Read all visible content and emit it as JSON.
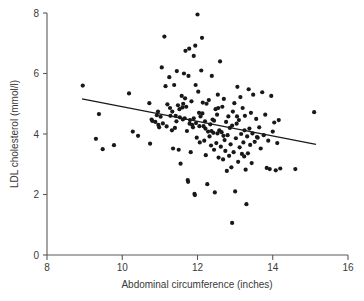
{
  "chart_data": {
    "type": "scatter",
    "title": "",
    "xlabel": "Abdominal circumference (inches)",
    "ylabel": "LDL cholesterol (mmol/l)",
    "xlim": [
      8,
      16
    ],
    "ylim": [
      0,
      8
    ],
    "xticks": [
      8,
      10,
      12,
      14,
      16
    ],
    "yticks": [
      0,
      2,
      4,
      6,
      8
    ],
    "xtick_labels": [
      "8",
      "10",
      "12",
      "14",
      "16"
    ],
    "ytick_labels": [
      "0",
      "2",
      "4",
      "6",
      "8"
    ],
    "grid": false,
    "legend": null,
    "marker": {
      "shape": "circle",
      "color": "#181818",
      "size": 2.1
    },
    "trendline": {
      "type": "linear-regression",
      "color": "#1a1a1a",
      "x_start": 8.93,
      "y_start": 5.16,
      "x_end": 15.15,
      "y_end": 3.66,
      "slope": -0.241,
      "intercept": 7.31
    },
    "points": [
      [
        8.95,
        5.6
      ],
      [
        9.38,
        4.66
      ],
      [
        9.3,
        3.84
      ],
      [
        9.48,
        3.5
      ],
      [
        9.78,
        3.63
      ],
      [
        10.18,
        5.34
      ],
      [
        10.28,
        4.08
      ],
      [
        10.42,
        3.94
      ],
      [
        10.72,
        5.02
      ],
      [
        10.74,
        3.68
      ],
      [
        10.78,
        4.48
      ],
      [
        10.8,
        4.43
      ],
      [
        10.88,
        4.4
      ],
      [
        10.92,
        4.62
      ],
      [
        10.95,
        4.74
      ],
      [
        10.96,
        4.3
      ],
      [
        10.98,
        4.22
      ],
      [
        11.02,
        4.57
      ],
      [
        11.05,
        6.2
      ],
      [
        11.08,
        4.35
      ],
      [
        11.12,
        7.22
      ],
      [
        11.15,
        5.58
      ],
      [
        11.18,
        4.25
      ],
      [
        11.2,
        4.98
      ],
      [
        11.25,
        5.88
      ],
      [
        11.28,
        4.6
      ],
      [
        11.32,
        4.12
      ],
      [
        11.35,
        3.52
      ],
      [
        11.38,
        5.62
      ],
      [
        11.4,
        4.2
      ],
      [
        11.42,
        4.6
      ],
      [
        11.45,
        6.08
      ],
      [
        11.48,
        4.95
      ],
      [
        11.5,
        3.48
      ],
      [
        11.52,
        4.82
      ],
      [
        11.55,
        3.02
      ],
      [
        11.58,
        5.26
      ],
      [
        11.6,
        4.88
      ],
      [
        11.62,
        5.0
      ],
      [
        11.64,
        6.0
      ],
      [
        11.66,
        4.52
      ],
      [
        11.68,
        6.75
      ],
      [
        11.7,
        4.9
      ],
      [
        11.72,
        4.1
      ],
      [
        11.74,
        2.48
      ],
      [
        11.75,
        2.42
      ],
      [
        11.76,
        5.92
      ],
      [
        11.78,
        6.82
      ],
      [
        11.8,
        4.46
      ],
      [
        11.82,
        3.4
      ],
      [
        11.84,
        5.08
      ],
      [
        11.86,
        4.3
      ],
      [
        11.88,
        4.22
      ],
      [
        11.9,
        6.58
      ],
      [
        11.92,
        2.02
      ],
      [
        11.93,
        1.98
      ],
      [
        11.94,
        6.92
      ],
      [
        11.95,
        5.62
      ],
      [
        11.96,
        4.36
      ],
      [
        11.98,
        3.88
      ],
      [
        12.0,
        7.95
      ],
      [
        12.02,
        5.4
      ],
      [
        12.04,
        4.7
      ],
      [
        12.06,
        3.72
      ],
      [
        12.08,
        4.58
      ],
      [
        12.1,
        6.1
      ],
      [
        12.12,
        7.18
      ],
      [
        12.14,
        5.04
      ],
      [
        12.16,
        4.26
      ],
      [
        12.18,
        3.78
      ],
      [
        12.2,
        4.42
      ],
      [
        12.22,
        3.3
      ],
      [
        12.24,
        5.0
      ],
      [
        12.26,
        2.34
      ],
      [
        12.28,
        4.08
      ],
      [
        12.3,
        5.12
      ],
      [
        12.32,
        3.92
      ],
      [
        12.34,
        4.32
      ],
      [
        12.36,
        3.62
      ],
      [
        12.38,
        5.92
      ],
      [
        12.4,
        4.48
      ],
      [
        12.42,
        4.04
      ],
      [
        12.44,
        3.48
      ],
      [
        12.46,
        2.07
      ],
      [
        12.48,
        4.82
      ],
      [
        12.5,
        3.7
      ],
      [
        12.52,
        4.64
      ],
      [
        12.54,
        5.3
      ],
      [
        12.56,
        3.22
      ],
      [
        12.58,
        4.12
      ],
      [
        12.6,
        6.4
      ],
      [
        12.62,
        3.58
      ],
      [
        12.64,
        4.06
      ],
      [
        12.66,
        4.9
      ],
      [
        12.68,
        3.16
      ],
      [
        12.7,
        5.16
      ],
      [
        12.72,
        3.8
      ],
      [
        12.74,
        3.44
      ],
      [
        12.76,
        4.4
      ],
      [
        12.78,
        2.78
      ],
      [
        12.8,
        3.96
      ],
      [
        12.82,
        4.58
      ],
      [
        12.84,
        3.28
      ],
      [
        12.86,
        4.2
      ],
      [
        12.88,
        3.66
      ],
      [
        12.9,
        2.9
      ],
      [
        12.92,
        1.06
      ],
      [
        12.94,
        4.74
      ],
      [
        12.96,
        3.4
      ],
      [
        12.98,
        5.02
      ],
      [
        13.0,
        2.1
      ],
      [
        13.02,
        3.86
      ],
      [
        13.04,
        4.34
      ],
      [
        13.06,
        5.56
      ],
      [
        13.08,
        3.08
      ],
      [
        13.1,
        4.46
      ],
      [
        13.12,
        3.56
      ],
      [
        13.14,
        5.22
      ],
      [
        13.16,
        4.0
      ],
      [
        13.18,
        3.34
      ],
      [
        13.2,
        4.86
      ],
      [
        13.22,
        3.72
      ],
      [
        13.24,
        3.26
      ],
      [
        13.26,
        4.6
      ],
      [
        13.28,
        2.82
      ],
      [
        13.3,
        1.68
      ],
      [
        13.32,
        3.92
      ],
      [
        13.34,
        3.36
      ],
      [
        13.36,
        5.48
      ],
      [
        13.38,
        4.18
      ],
      [
        13.4,
        3.64
      ],
      [
        13.42,
        4.7
      ],
      [
        13.44,
        3.04
      ],
      [
        13.46,
        4.02
      ],
      [
        13.48,
        5.3
      ],
      [
        13.52,
        3.74
      ],
      [
        13.56,
        4.5
      ],
      [
        13.6,
        3.88
      ],
      [
        13.64,
        4.22
      ],
      [
        13.68,
        3.52
      ],
      [
        13.72,
        5.38
      ],
      [
        13.76,
        3.96
      ],
      [
        13.8,
        4.64
      ],
      [
        13.84,
        2.88
      ],
      [
        13.88,
        3.78
      ],
      [
        13.92,
        2.84
      ],
      [
        13.96,
        5.26
      ],
      [
        14.0,
        4.08
      ],
      [
        14.04,
        4.38
      ],
      [
        14.08,
        2.8
      ],
      [
        14.12,
        3.7
      ],
      [
        14.16,
        4.46
      ],
      [
        14.2,
        2.86
      ],
      [
        14.6,
        2.84
      ],
      [
        15.1,
        4.72
      ],
      [
        11.33,
        4.74
      ],
      [
        11.44,
        4.42
      ],
      [
        11.53,
        4.55
      ],
      [
        11.61,
        4.48
      ],
      [
        11.79,
        4.34
      ],
      [
        12.05,
        4.26
      ],
      [
        12.21,
        4.18
      ],
      [
        12.37,
        4.1
      ],
      [
        12.53,
        4.02
      ],
      [
        12.69,
        3.94
      ],
      [
        11.9,
        4.52
      ],
      [
        12.44,
        4.44
      ],
      [
        12.92,
        4.28
      ],
      [
        13.25,
        4.12
      ],
      [
        13.58,
        3.9
      ],
      [
        11.27,
        4.86
      ],
      [
        11.67,
        5.18
      ],
      [
        12.13,
        4.68
      ],
      [
        12.55,
        4.86
      ],
      [
        13.05,
        4.58
      ]
    ],
    "n_points": 180
  }
}
